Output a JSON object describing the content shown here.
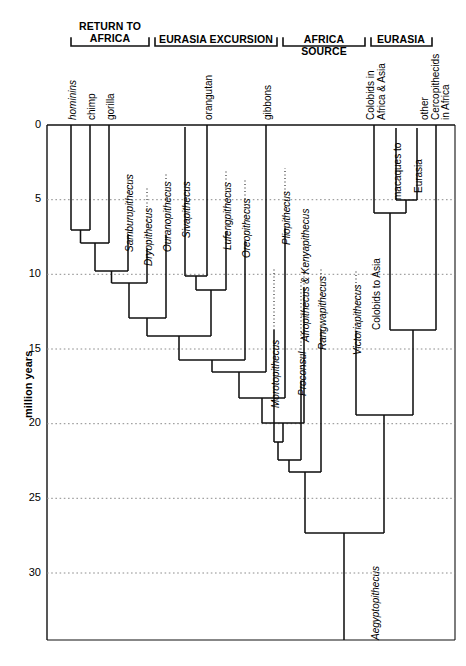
{
  "figure": {
    "type": "phylogenetic-tree",
    "axis": {
      "label": "million years",
      "ticks": [
        "0",
        "5",
        "10",
        "15",
        "20",
        "25",
        "30"
      ],
      "tick_values": [
        0,
        5,
        10,
        15,
        20,
        25,
        30
      ],
      "range": [
        0,
        33
      ],
      "grid": "dotted"
    },
    "group_headers": [
      {
        "id": "return-to-africa",
        "text": "RETURN TO\nAFRICA",
        "x": 70,
        "w": 108
      },
      {
        "id": "eurasia-excursion",
        "text": "EURASIA EXCURSION",
        "x": 152,
        "w": 128
      },
      {
        "id": "africa-source",
        "text": "AFRICA SOURCE",
        "x": 281,
        "w": 88
      },
      {
        "id": "eurasia",
        "text": "EURASIA",
        "x": 370,
        "w": 60
      }
    ],
    "extant_tips": [
      {
        "id": "hominins",
        "label": "hominins",
        "italic": true,
        "x": 71,
        "lines": 1
      },
      {
        "id": "chimp",
        "label": "chimp",
        "italic": false,
        "x": 90,
        "lines": 1
      },
      {
        "id": "gorilla",
        "label": "gorilla",
        "italic": false,
        "x": 109,
        "lines": 1
      },
      {
        "id": "orangutan",
        "label": "orangutan",
        "italic": false,
        "x": 207,
        "lines": 1
      },
      {
        "id": "gibbons",
        "label": "gibbons",
        "italic": false,
        "x": 266,
        "lines": 1
      },
      {
        "id": "colobids-africa-asia",
        "label": "Colobids in\nAfrica & Asia",
        "italic": false,
        "x": 374,
        "lines": 2
      },
      {
        "id": "other-cercopithecids",
        "label": "other\nCercopithecids\nin Africa",
        "italic": false,
        "x": 417,
        "lines": 3
      }
    ],
    "fossil_taxa": [
      {
        "id": "samburupithecus",
        "label": "Samburupithecus",
        "italic": true
      },
      {
        "id": "dryopithecus",
        "label": "Dryopithecus",
        "italic": true
      },
      {
        "id": "ouranopithecus",
        "label": "Ouranopithecus",
        "italic": true
      },
      {
        "id": "sivapithecus",
        "label": "Sivapithecus",
        "italic": true
      },
      {
        "id": "lufengpithecus",
        "label": "Lufengpithecus",
        "italic": true
      },
      {
        "id": "oreopithecus",
        "label": "Oreopithecus",
        "italic": true
      },
      {
        "id": "pliopithecus",
        "label": "Pliopithecus",
        "italic": true
      },
      {
        "id": "morotopithecus",
        "label": "Morotopithecus",
        "italic": true
      },
      {
        "id": "afropithecus-kenyapithecus",
        "label": "Afropithecus & Kenyapithecus",
        "italic": true
      },
      {
        "id": "proconsul",
        "label": "Proconsul",
        "italic": true
      },
      {
        "id": "rangwapithecus",
        "label": "Rangwapithecus",
        "italic": true
      },
      {
        "id": "victoriapithecus",
        "label": "Victoriapithecus",
        "italic": true
      },
      {
        "id": "aegyptopithecus",
        "label": "Aegyptopithecus",
        "italic": true
      }
    ],
    "event_labels": [
      {
        "id": "colobids-to-asia",
        "label": "Colobids to Asia",
        "italic": false
      },
      {
        "id": "macaques-to-eurasia",
        "label": "macaques to",
        "italic": false
      },
      {
        "id": "eurasia-branch",
        "label": "Eurasia",
        "italic": false
      }
    ],
    "colors": {
      "line": "#1a1a1a",
      "grid": "#9a9a9a",
      "background": "#ffffff",
      "text": "#000000"
    }
  },
  "branch_labels": {
    "hominins": "hominins",
    "chimp": "chimp",
    "gorilla": "gorilla",
    "samburupithecus": "Samburupithecus",
    "dryopithecus": "Dryopithecus",
    "ouranopithecus": "Ouranopithecus",
    "sivapithecus": "Sivapithecus",
    "orangutan": "orangutan",
    "lufengpithecus": "Lufengpithecus",
    "oreopithecus": "Oreopithecus",
    "gibbons": "gibbons",
    "pliopithecus": "Pliopithecus",
    "afrokenya": "Afropithecus & Kenyapithecus",
    "morotopithecus": "Morotopithecus",
    "proconsul": "Proconsul",
    "rangwapithecus": "Rangwapithecus",
    "victoriapithecus": "Victoriapithecus",
    "colobids_to_asia": "Colobids to Asia",
    "colobids_africa_asia": "Colobids in\nAfrica & Asia",
    "macaques_to": "macaques to",
    "eurasia": "Eurasia",
    "other_cerco": "other\nCercopithecids\nin Africa",
    "aegyptopithecus": "Aegyptopithecus"
  },
  "group_headers": {
    "g0": "RETURN TO\nAFRICA",
    "g1": "EURASIA EXCURSION",
    "g2": "AFRICA SOURCE",
    "g3": "EURASIA"
  },
  "axis": {
    "title": "million years",
    "t0": "0",
    "t5": "5",
    "t10": "10",
    "t15": "15",
    "t20": "20",
    "t25": "25",
    "t30": "30"
  }
}
